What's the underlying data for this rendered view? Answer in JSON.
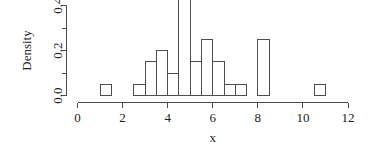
{
  "chart_data": {
    "type": "bar",
    "subtype": "histogram",
    "title": "",
    "xlabel": "x",
    "ylabel": "Density",
    "xlim": [
      0,
      12
    ],
    "ylim": [
      0,
      0.5
    ],
    "grid": false,
    "legend": null,
    "bin_width": 0.5,
    "x_ticks": [
      0,
      2,
      4,
      6,
      8,
      10,
      12
    ],
    "x_tick_labels": [
      "0",
      "2",
      "4",
      "6",
      "8",
      "10",
      "12"
    ],
    "y_ticks": [
      0.0,
      0.1,
      0.2,
      0.3,
      0.4
    ],
    "y_tick_labels": [
      "0.0",
      "",
      "0.2",
      "",
      "0.4"
    ],
    "y_labeled_ticks": [
      0.0,
      0.2,
      0.4
    ],
    "bins": [
      {
        "start": 1.0,
        "end": 1.5,
        "density": 0.05
      },
      {
        "start": 2.5,
        "end": 3.0,
        "density": 0.05
      },
      {
        "start": 3.0,
        "end": 3.5,
        "density": 0.15
      },
      {
        "start": 3.5,
        "end": 4.0,
        "density": 0.2
      },
      {
        "start": 4.0,
        "end": 4.5,
        "density": 0.1
      },
      {
        "start": 4.5,
        "end": 5.0,
        "density": 0.5
      },
      {
        "start": 5.0,
        "end": 5.5,
        "density": 0.15
      },
      {
        "start": 5.5,
        "end": 6.0,
        "density": 0.25
      },
      {
        "start": 6.0,
        "end": 6.5,
        "density": 0.15
      },
      {
        "start": 6.5,
        "end": 7.0,
        "density": 0.05
      },
      {
        "start": 7.0,
        "end": 7.5,
        "density": 0.05
      },
      {
        "start": 8.0,
        "end": 8.5,
        "density": 0.25
      },
      {
        "start": 10.5,
        "end": 11.0,
        "density": 0.05
      }
    ],
    "categories": [
      "1.0-1.5",
      "2.5-3.0",
      "3.0-3.5",
      "3.5-4.0",
      "4.0-4.5",
      "4.5-5.0",
      "5.0-5.5",
      "5.5-6.0",
      "6.0-6.5",
      "6.5-7.0",
      "7.0-7.5",
      "8.0-8.5",
      "10.5-11.0"
    ],
    "values": [
      0.05,
      0.05,
      0.15,
      0.2,
      0.1,
      0.5,
      0.15,
      0.25,
      0.15,
      0.05,
      0.05,
      0.25,
      0.05
    ],
    "colors": {
      "bar_stroke": "#4d4d4d",
      "bar_fill": "none",
      "axis": "#4d4d4d",
      "text": "#222222",
      "background": "#ffffff"
    }
  }
}
